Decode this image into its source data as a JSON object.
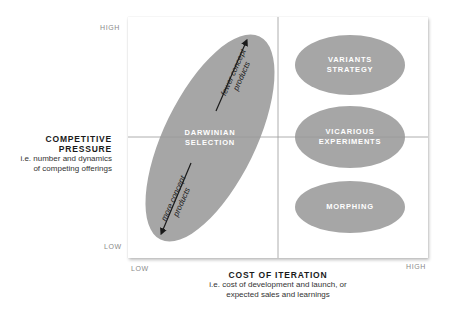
{
  "y_axis": {
    "high_label": "HIGH",
    "low_label": "LOW",
    "title_line1": "COMPETITIVE",
    "title_line2": "PRESSURE",
    "sub_line1": "i.e. number and dynamics",
    "sub_line2": "of competing offerings"
  },
  "x_axis": {
    "low_label": "LOW",
    "high_label": "HIGH",
    "title": "COST OF ITERATION",
    "sub_line1": "i.e. cost of development and launch, or",
    "sub_line2": "expected sales and learnings"
  },
  "colors": {
    "ellipse_fill": "#a6a6a6",
    "ellipse_text": "#ffffff",
    "grid_line": "#9a9a9a",
    "arrow": "#1a1a1a"
  },
  "shapes": {
    "darwinian": {
      "line1": "DARWINIAN",
      "line2": "SELECTION"
    },
    "variants": {
      "line1": "VARIANTS",
      "line2": "STRATEGY"
    },
    "vicarious": {
      "line1": "VICARIOUS",
      "line2": "EXPERIMENTS"
    },
    "morphing": {
      "line1": "MORPHING"
    }
  },
  "arrows": {
    "up": {
      "line1": "fewer concept",
      "line2": "products"
    },
    "down": {
      "line1": "more concept",
      "line2": "products"
    }
  }
}
